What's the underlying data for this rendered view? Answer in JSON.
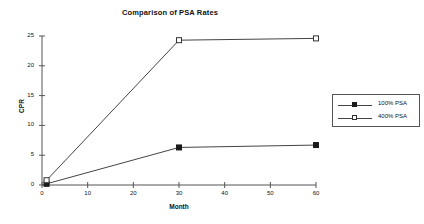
{
  "chart_data": {
    "type": "line",
    "title": "Comparison of PSA Rates",
    "xlabel": "Month",
    "ylabel": "CPR",
    "xlim": [
      0,
      60
    ],
    "ylim": [
      0,
      25
    ],
    "xticks": [
      0,
      10,
      20,
      30,
      40,
      50,
      60
    ],
    "yticks": [
      0,
      5,
      10,
      15,
      20,
      25
    ],
    "grid": false,
    "legend_position": "right",
    "series": [
      {
        "name": "100% PSA",
        "marker": "filled-square",
        "x": [
          1,
          30,
          60
        ],
        "values": [
          0.2,
          6.3,
          6.7
        ]
      },
      {
        "name": "400% PSA",
        "marker": "hollow-square",
        "x": [
          1,
          30,
          60
        ],
        "values": [
          0.8,
          24.3,
          24.6
        ]
      }
    ]
  },
  "legend": {
    "items": [
      {
        "label": "100% PSA"
      },
      {
        "label": "400% PSA"
      }
    ]
  }
}
